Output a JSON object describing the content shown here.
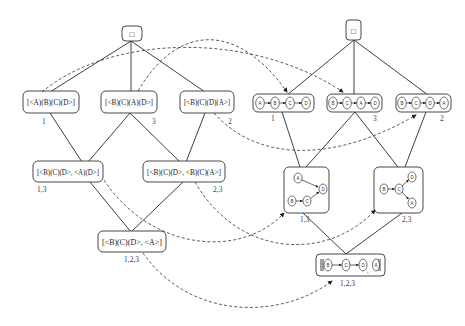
{
  "left_lattice": {
    "root": {
      "label": "□"
    },
    "level1": [
      {
        "label": "[<A)(B)(C)(D>]",
        "sub": "1"
      },
      {
        "label": "[<B)(C)(A)(D>]",
        "sub": "3"
      },
      {
        "label": "[<B)(C)(D)(A>]",
        "sub": "2"
      }
    ],
    "level2": [
      {
        "label": "[<B)(C)(D>, <A)(D>]",
        "sub": "1,3"
      },
      {
        "label": "[<B)(C)(D>, <B)(C)(A>]",
        "sub": "2,3"
      }
    ],
    "level3": [
      {
        "label": "[<B)(C)(D>, <A>]",
        "sub": "1,2,3"
      }
    ]
  },
  "right_lattice": {
    "root": {
      "label": "□"
    },
    "level1": [
      {
        "nodes": [
          "A",
          "B",
          "C",
          "D"
        ],
        "sub": "1"
      },
      {
        "nodes": [
          "B",
          "C",
          "A",
          "D"
        ],
        "sub": "3"
      },
      {
        "nodes": [
          "B",
          "C",
          "D",
          "A"
        ],
        "sub": "2"
      }
    ],
    "level2": [
      {
        "nodes": [
          "A",
          "B",
          "C",
          "D"
        ],
        "edges": [
          "A→D",
          "B→C",
          "C→D"
        ],
        "sub": "1,3"
      },
      {
        "nodes": [
          "B",
          "C",
          "D",
          "A"
        ],
        "edges": [
          "B→C",
          "C→D",
          "C→A"
        ],
        "sub": "2,3"
      }
    ],
    "level3": [
      {
        "nodes": [
          "B",
          "C",
          "D",
          "A"
        ],
        "edges": [
          "B→C",
          "C→D"
        ],
        "sub": "1,2,3"
      }
    ]
  }
}
